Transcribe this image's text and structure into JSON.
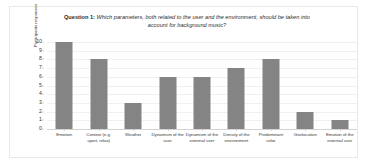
{
  "chart_data": {
    "type": "bar",
    "title_prefix": "Question 1:",
    "title": " Which parameters, both related to the user and the environment, should be taken into account for background music?",
    "title_full": "Question 1: Which parameters, both related to the user and the environment, should be taken into account for background music?",
    "xlabel": "",
    "ylabel": "Participants responses",
    "ylim": [
      0,
      10
    ],
    "yticks": [
      0,
      1,
      2,
      3,
      4,
      5,
      6,
      7,
      8,
      9,
      10
    ],
    "grid": true,
    "legend": false,
    "bar_color": "#848484",
    "categories": [
      "Emotion",
      "Context  (e.g. sport, relax)",
      "Weather",
      "Dynamism of the user",
      "Dynamism of the external user",
      "Density of the environment",
      "Predominant color",
      "Geolocation",
      "Emotion of the external user"
    ],
    "values": [
      10,
      8,
      3,
      6,
      6,
      7,
      8,
      2,
      1
    ]
  }
}
